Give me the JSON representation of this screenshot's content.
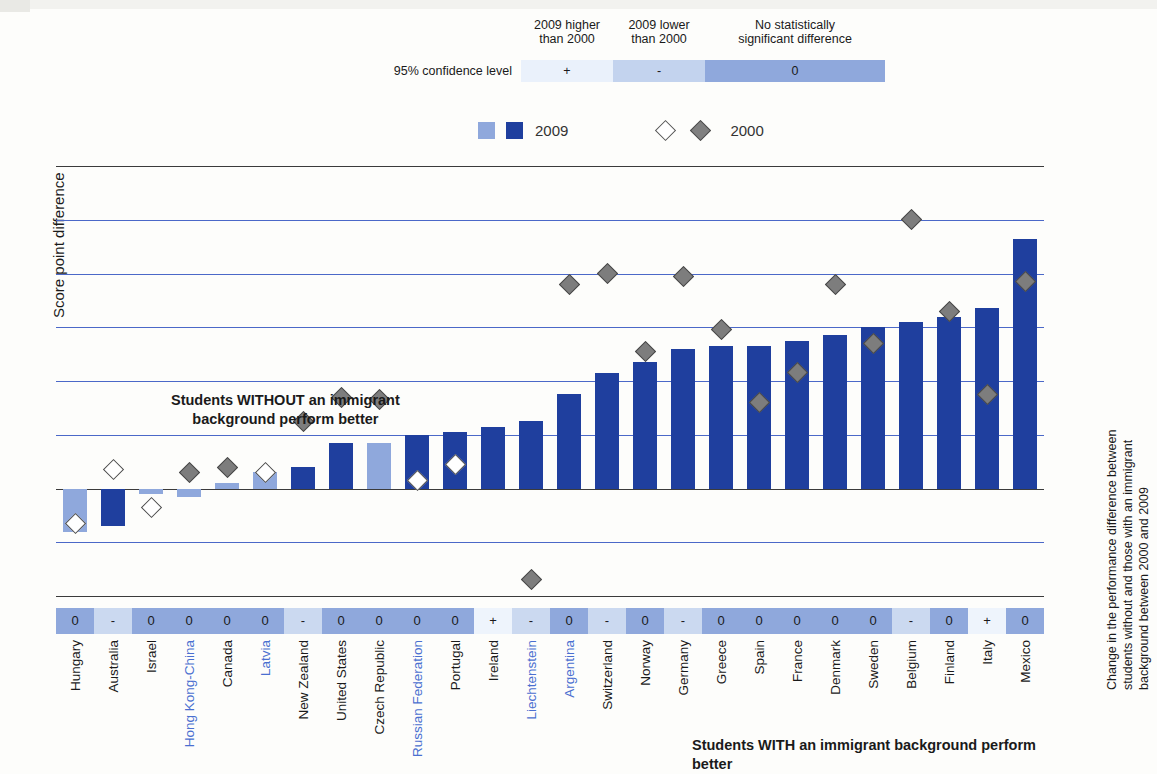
{
  "significance_legend": {
    "row_label": "95% confidence level",
    "headers": [
      "2009 higher than 2000",
      "2009 lower than 2000",
      "No statistically significant difference"
    ],
    "header_lines": [
      [
        "2009 higher",
        "than 2000"
      ],
      [
        "2009 lower",
        "than 2000"
      ],
      [
        "No statistically",
        "significant difference"
      ]
    ],
    "symbols": [
      "+",
      "-",
      "0"
    ],
    "colors": [
      "#eaf1fb",
      "#c3d3ee",
      "#8fa8dc"
    ]
  },
  "series_legend": {
    "bar_label": "2009",
    "marker_label": "2000",
    "bar_colors": [
      "#8fa8dc",
      "#1f3f9e"
    ],
    "marker_colors": [
      "#ffffff",
      "#808080"
    ]
  },
  "annotations": {
    "without": "Students WITHOUT an immigrant\nbackground perform better",
    "without_line1": "Students WITHOUT an immigrant",
    "without_line2": "background perform better",
    "with": "Students WITH an immigrant background perform better"
  },
  "axes": {
    "ylabel": "Score point difference",
    "right_label_line1": "Change in the performance difference between",
    "right_label_line2": "students without and those with an immigrant",
    "right_label_line3": "background between 2000 and 2009",
    "yticks": [
      120,
      100,
      80,
      60,
      40,
      20,
      0,
      -20,
      -40
    ],
    "ymin": -40,
    "ymax": 120
  },
  "chart_data": {
    "type": "bar",
    "title": "",
    "xlabel": "",
    "ylabel": "Score point difference",
    "ylim": [
      -40,
      120
    ],
    "grid": true,
    "legend_position": "top",
    "categories": [
      "Hungary",
      "Australia",
      "Israel",
      "Hong Kong-China",
      "Canada",
      "Latvia",
      "New Zealand",
      "United States",
      "Czech Republic",
      "Russian Federation",
      "Portugal",
      "Ireland",
      "Liechtenstein",
      "Argentina",
      "Switzerland",
      "Norway",
      "Germany",
      "Greece",
      "Spain",
      "France",
      "Denmark",
      "Sweden",
      "Belgium",
      "Finland",
      "Italy",
      "Mexico"
    ],
    "category_types": [
      "oecd",
      "oecd",
      "oecd",
      "partner",
      "oecd",
      "partner",
      "oecd",
      "oecd",
      "oecd",
      "partner",
      "oecd",
      "oecd",
      "partner",
      "partner",
      "oecd",
      "oecd",
      "oecd",
      "oecd",
      "oecd",
      "oecd",
      "oecd",
      "oecd",
      "oecd",
      "oecd",
      "oecd",
      "oecd"
    ],
    "series": [
      {
        "name": "2009",
        "values": [
          -16,
          -14,
          -2,
          -3,
          2,
          6,
          8,
          17,
          17,
          20,
          21,
          23,
          25,
          35,
          43,
          47,
          52,
          53,
          53,
          55,
          57,
          60,
          62,
          64,
          67,
          93
        ],
        "significant": [
          false,
          true,
          false,
          false,
          false,
          false,
          true,
          true,
          false,
          true,
          true,
          true,
          true,
          true,
          true,
          true,
          true,
          true,
          true,
          true,
          true,
          true,
          true,
          true,
          true,
          true
        ]
      },
      {
        "name": "2000",
        "values": [
          -13,
          7,
          -7,
          6,
          8,
          6,
          25,
          34,
          33,
          3,
          9,
          null,
          -34,
          76,
          80,
          51,
          79,
          59,
          32,
          43,
          76,
          54,
          100,
          66,
          35,
          77
        ],
        "filled": [
          false,
          false,
          false,
          true,
          true,
          false,
          true,
          true,
          true,
          false,
          false,
          null,
          true,
          true,
          true,
          true,
          true,
          true,
          true,
          true,
          true,
          true,
          true,
          true,
          true,
          true
        ]
      }
    ],
    "significance": [
      "0",
      "-",
      "0",
      "0",
      "0",
      "0",
      "-",
      "0",
      "0",
      "0",
      "0",
      "+",
      "-",
      "0",
      "-",
      "0",
      "-",
      "0",
      "0",
      "0",
      "0",
      "0",
      "-",
      "0",
      "+",
      "0"
    ]
  }
}
